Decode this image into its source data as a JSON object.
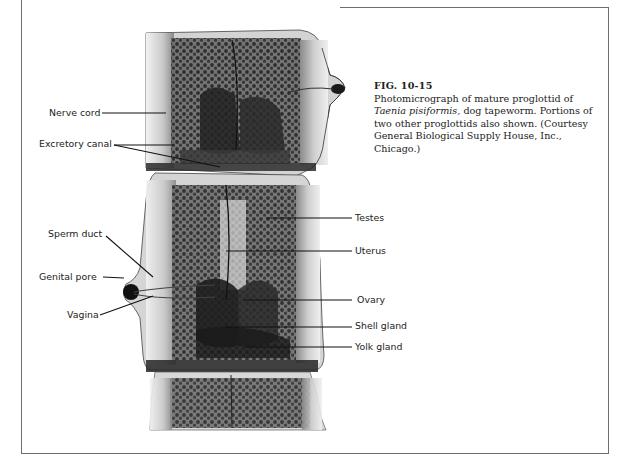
{
  "figure": {
    "number": "FIG. 10-15",
    "caption_parts": {
      "lead": "Photomicrograph of mature proglottid of ",
      "species": "Taenia pisiformis,",
      "rest": " dog tapeworm. Portions of two other proglottids also shown. (Courtesy General Biological Supply House, Inc., Chicago.)"
    }
  },
  "labels": {
    "left": [
      {
        "text": "Nerve cord"
      },
      {
        "text": "Excretory canal"
      },
      {
        "text": "Sperm duct"
      },
      {
        "text": "Genital pore"
      },
      {
        "text": "Vagina"
      }
    ],
    "right": [
      {
        "text": "Testes"
      },
      {
        "text": "Uterus"
      },
      {
        "text": "Ovary"
      },
      {
        "text": "Shell gland"
      },
      {
        "text": "Yolk gland"
      }
    ]
  },
  "image": {
    "subject": "mature proglottid photomicrograph",
    "colors": {
      "ink": "#1a1a1a",
      "frame": "#6e6e6e",
      "tissue_light": "#d8d8d8",
      "tissue_dark": "#2a2a2a"
    }
  }
}
